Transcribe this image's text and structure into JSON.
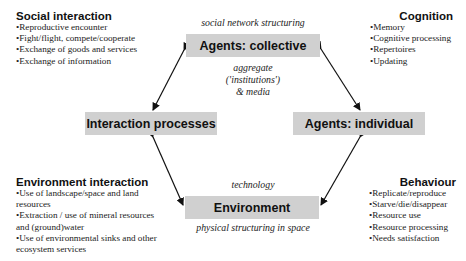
{
  "panels": {
    "social": {
      "title": "Social interaction",
      "items": [
        "Reproductive encounter",
        "Fight/flight, compete/cooperate",
        "Exchange of goods and services",
        "Exchange of information"
      ]
    },
    "cognition": {
      "title": "Cognition",
      "items": [
        "Memory",
        "Cognitive processing",
        "Repertoires",
        "Updating"
      ]
    },
    "environment_interaction": {
      "title": "Environment interaction",
      "items": [
        "Use of landscape/space and land",
        "resources",
        "Extraction / use of mineral resources",
        "and (ground)water",
        "Use of environmental sinks and other",
        "ecosystem services"
      ]
    },
    "behaviour": {
      "title": "Behaviour",
      "items": [
        "Replicate/reproduce",
        "Starve/die/disappear",
        "Resource use",
        "Resource processing",
        "Needs satisfaction"
      ]
    }
  },
  "nodes": {
    "collective": "Agents: collective",
    "interaction": "Interaction processes",
    "individual": "Agents: individual",
    "environment": "Environment"
  },
  "captions": {
    "social_network": "social network structuring",
    "aggregate_1": "aggregate",
    "aggregate_2": "('institutions')",
    "aggregate_3": "& media",
    "technology": "technology",
    "physical": "physical structuring in space"
  },
  "colors": {
    "box_fill": "#d0d0d0",
    "arrow": "#111111"
  }
}
